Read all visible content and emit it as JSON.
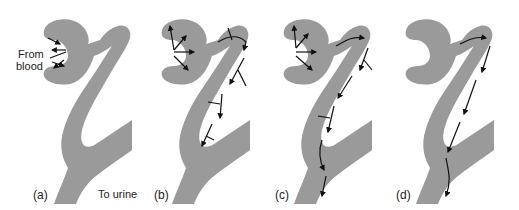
{
  "figure": {
    "colors": {
      "tissue": "#9a9a9a",
      "arrow": "#111111",
      "background": "#ffffff"
    },
    "panels": [
      {
        "id": "a",
        "label": "(a)",
        "description": "Filtration from blood into capsule"
      },
      {
        "id": "b",
        "label": "(b)",
        "description": "Filtration plus reabsorption along tubule"
      },
      {
        "id": "c",
        "label": "(c)",
        "description": "Filtration, reabsorption and secretion"
      },
      {
        "id": "d",
        "label": "(d)",
        "description": "Flow through tubule to urine"
      }
    ],
    "annotations": {
      "from_blood_line1": "From",
      "from_blood_line2": "blood",
      "to_urine": "To urine"
    }
  }
}
